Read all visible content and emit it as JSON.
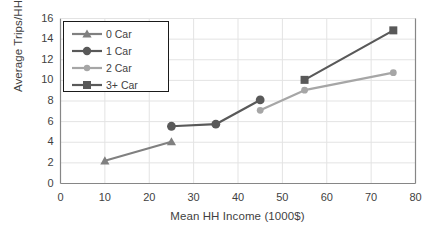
{
  "chart_data": {
    "type": "line",
    "title": "",
    "xlabel": "Mean HH Income (1000$)",
    "ylabel": "Average Trips/HH",
    "xlim": [
      0,
      80
    ],
    "ylim": [
      0,
      16
    ],
    "xticks": [
      "0",
      "10",
      "20",
      "30",
      "40",
      "50",
      "60",
      "70",
      "80"
    ],
    "yticks": [
      "0",
      "2",
      "4",
      "6",
      "8",
      "10",
      "12",
      "14",
      "16"
    ],
    "grid": true,
    "legend_position": "upper-left",
    "series": [
      {
        "name": "0 Car",
        "marker": "triangle",
        "color": "#808080",
        "x": [
          10,
          25
        ],
        "y": [
          2.2,
          4.05
        ]
      },
      {
        "name": "1 Car",
        "marker": "circle",
        "color": "#595959",
        "x": [
          25,
          35,
          45
        ],
        "y": [
          5.55,
          5.75,
          8.1
        ]
      },
      {
        "name": "2 Car",
        "marker": "circle-small",
        "color": "#a6a6a6",
        "x": [
          45,
          55,
          75
        ],
        "y": [
          7.1,
          9.05,
          10.75
        ]
      },
      {
        "name": "3+ Car",
        "marker": "square",
        "color": "#595959",
        "x": [
          55,
          75
        ],
        "y": [
          10.05,
          14.85
        ]
      }
    ]
  },
  "legend": {
    "items": [
      {
        "label": "0 Car"
      },
      {
        "label": "1 Car"
      },
      {
        "label": "2 Car"
      },
      {
        "label": "3+ Car"
      }
    ]
  },
  "colors": {
    "axis": "#868686",
    "grid": "#e3e3e3",
    "text": "#3f3f3f",
    "legend_border": "#1a1a1a",
    "background": "#ffffff"
  }
}
